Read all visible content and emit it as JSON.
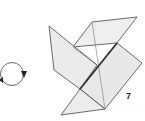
{
  "diagram": {
    "type": "origami-step",
    "step_number": "7",
    "instruction_symbol": "turn-over",
    "colors": {
      "paper": "#e9e9e9",
      "stroke": "#444444",
      "arrow": "#333333",
      "background": "#ffffff"
    }
  }
}
